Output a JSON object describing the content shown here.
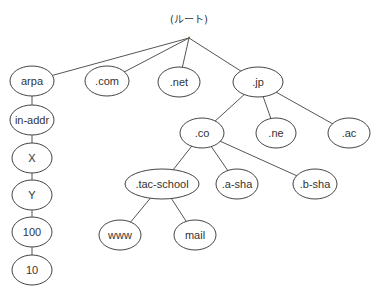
{
  "diagram": {
    "type": "tree",
    "root": {
      "id": "root",
      "label": "(ルート)",
      "dot": ".",
      "x": 189,
      "y": 38
    },
    "nodes": [
      {
        "id": "arpa",
        "label": "arpa",
        "x": 32,
        "y": 81,
        "rx": 22
      },
      {
        "id": "com",
        "label": ".com",
        "x": 107,
        "y": 81,
        "rx": 22
      },
      {
        "id": "net",
        "label": ".net",
        "x": 179,
        "y": 82,
        "rx": 21
      },
      {
        "id": "jp",
        "label": ".jp",
        "x": 258,
        "y": 82,
        "rx": 25
      },
      {
        "id": "in-addr",
        "label": "in-addr",
        "x": 32,
        "y": 120,
        "rx": 22
      },
      {
        "id": "X",
        "label": "X",
        "x": 32,
        "y": 158,
        "rx": 20
      },
      {
        "id": "Y",
        "label": "Y",
        "x": 32,
        "y": 195,
        "rx": 20
      },
      {
        "id": "n100",
        "label": "100",
        "x": 32,
        "y": 232,
        "rx": 20
      },
      {
        "id": "n10",
        "label": "10",
        "x": 32,
        "y": 270,
        "rx": 20
      },
      {
        "id": "co",
        "label": ".co",
        "x": 202,
        "y": 133,
        "rx": 22
      },
      {
        "id": "ne",
        "label": ".ne",
        "x": 276,
        "y": 133,
        "rx": 20
      },
      {
        "id": "ac",
        "label": ".ac",
        "x": 349,
        "y": 133,
        "rx": 21
      },
      {
        "id": "tac-school",
        "label": ".tac-school",
        "x": 162,
        "y": 184,
        "rx": 37
      },
      {
        "id": "a-sha",
        "label": ".a-sha",
        "x": 237,
        "y": 184,
        "rx": 21
      },
      {
        "id": "b-sha",
        "label": ".b-sha",
        "x": 315,
        "y": 184,
        "rx": 22
      },
      {
        "id": "www",
        "label": "www",
        "x": 120,
        "y": 235,
        "rx": 21
      },
      {
        "id": "mail",
        "label": "mail",
        "x": 195,
        "y": 235,
        "rx": 21
      }
    ],
    "edges": [
      [
        "root",
        "arpa"
      ],
      [
        "root",
        "com"
      ],
      [
        "root",
        "net"
      ],
      [
        "root",
        "jp"
      ],
      [
        "arpa",
        "in-addr"
      ],
      [
        "in-addr",
        "X"
      ],
      [
        "X",
        "Y"
      ],
      [
        "Y",
        "n100"
      ],
      [
        "n100",
        "n10"
      ],
      [
        "jp",
        "co"
      ],
      [
        "jp",
        "ne"
      ],
      [
        "jp",
        "ac"
      ],
      [
        "co",
        "tac-school"
      ],
      [
        "co",
        "a-sha"
      ],
      [
        "co",
        "b-sha"
      ],
      [
        "tac-school",
        "www"
      ],
      [
        "tac-school",
        "mail"
      ]
    ]
  }
}
